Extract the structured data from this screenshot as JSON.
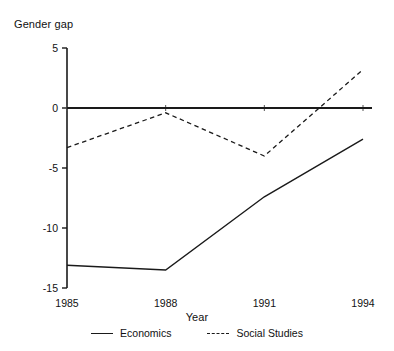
{
  "chart_data": {
    "type": "line",
    "title": "",
    "xlabel": "Year",
    "ylabel": "Gender gap",
    "categories": [
      "1985",
      "1988",
      "1991",
      "1994"
    ],
    "x": [
      1985,
      1988,
      1991,
      1994
    ],
    "xlim": [
      1985,
      1994
    ],
    "ylim": [
      -15,
      5
    ],
    "yticks": [
      5,
      0,
      -5,
      -10,
      -15
    ],
    "ytick_labels": [
      "5",
      "0",
      "-5",
      "-10",
      "-15"
    ],
    "xticks": [
      1985,
      1988,
      1991,
      1994
    ],
    "xtick_labels": [
      "1985",
      "1988",
      "1991",
      "1994"
    ],
    "grid": false,
    "legend_position": "bottom",
    "zero_line": true,
    "series": [
      {
        "name": "Economics",
        "style": "solid",
        "color": "#1a1a1a",
        "values": [
          -13.1,
          -13.5,
          -7.4,
          -2.6
        ]
      },
      {
        "name": "Social Studies",
        "style": "dashed",
        "color": "#1a1a1a",
        "values": [
          -3.3,
          -0.4,
          -4.0,
          3.2
        ]
      }
    ]
  },
  "axes": {
    "y_title": "Gender gap",
    "x_title": "Year"
  },
  "legend": {
    "items": [
      {
        "label": "Economics",
        "style": "solid"
      },
      {
        "label": "Social Studies",
        "style": "dashed"
      }
    ]
  }
}
